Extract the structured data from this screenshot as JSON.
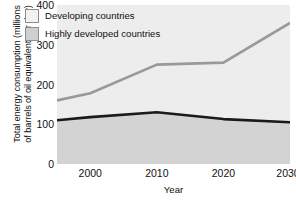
{
  "chart_data": {
    "type": "area",
    "title": "",
    "xlabel": "Year",
    "ylabel": "Total energy consumption (millions\nof barrels of oil equivalent per day)",
    "x": [
      1995,
      2000,
      2010,
      2020,
      2030
    ],
    "xlim": [
      1995,
      2030
    ],
    "ylim": [
      0,
      400
    ],
    "xticks": [
      2000,
      2010,
      2020,
      2030
    ],
    "xtick_labels": [
      "2000",
      "2010",
      "2020",
      "2030"
    ],
    "yticks": [
      0,
      100,
      200,
      300,
      400
    ],
    "ytick_labels": [
      "0",
      "100",
      "200",
      "300",
      "400"
    ],
    "grid": false,
    "stacked": false,
    "legend_position": "top-left",
    "series": [
      {
        "name": "Developing countries",
        "values": [
          160,
          178,
          250,
          255,
          355
        ],
        "line_color": "#999999",
        "fill_color": "#ededed"
      },
      {
        "name": "Highly developed countries",
        "values": [
          110,
          118,
          130,
          113,
          105
        ],
        "line_color": "#1a1a1a",
        "fill_color": "#d3d3d3"
      }
    ]
  },
  "legend": {
    "items": [
      {
        "label": "Developing countries",
        "swatch": "developing"
      },
      {
        "label": "Highly developed countries",
        "swatch": "developed"
      }
    ]
  },
  "colors": {
    "plot_background": "#ededed",
    "developed_fill": "#d3d3d3",
    "developing_line": "#999999",
    "developed_line": "#1a1a1a",
    "text": "#111111"
  }
}
